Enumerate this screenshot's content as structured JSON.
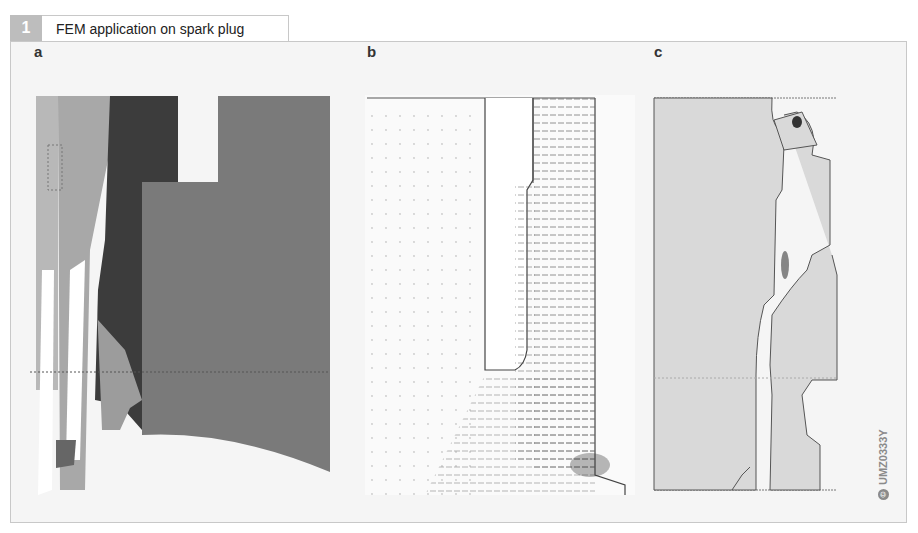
{
  "figure": {
    "number": "1",
    "title": "FEM application on spark plug",
    "image_code": "UMZ0333Y",
    "copyright_symbol": "©"
  },
  "panels": [
    {
      "label": "a",
      "description": "gray-scale FEM region map of spark plug cross-section"
    },
    {
      "label": "b",
      "description": "electric field vector plot"
    },
    {
      "label": "c",
      "description": "field intensity contour plot"
    }
  ],
  "colors": {
    "badge": "#bdbdbd",
    "frame_bg": "#f5f5f5",
    "frame_border": "#c8c8c8",
    "region_dark": "#3c3c3c",
    "region_mid": "#7a7a7a",
    "region_light": "#a8a8a8",
    "panel_c_fill": "#d9d9d9"
  }
}
